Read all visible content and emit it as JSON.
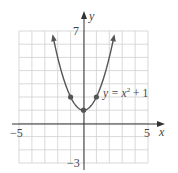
{
  "chart_data": {
    "type": "line",
    "title": "",
    "xlabel": "x",
    "ylabel": "y",
    "xlim": [
      -5,
      5
    ],
    "ylim": [
      -3,
      7
    ],
    "grid": true,
    "x_tick_labels": [
      "-5",
      "5"
    ],
    "y_tick_labels": [
      "7",
      "-3"
    ],
    "series": [
      {
        "name": "y = x² + 1",
        "function": "x^2 + 1",
        "x": [
          -2.449,
          -2,
          -1,
          0,
          1,
          2,
          2.449
        ],
        "y": [
          7,
          5,
          2,
          1,
          2,
          5,
          7
        ],
        "marked_points": [
          [
            -1,
            2
          ],
          [
            0,
            1
          ],
          [
            1,
            2
          ]
        ],
        "color": "#555555"
      }
    ],
    "annotations": [
      {
        "text": "y = x² + 1",
        "x": 1.5,
        "y": 2.3
      }
    ]
  },
  "labels": {
    "x_axis": "x",
    "y_axis": "y",
    "x_min": "−5",
    "x_max": "5",
    "y_max": "7",
    "y_min": "−3",
    "eq_y": "y = x",
    "eq_exp": "2",
    "eq_tail": " + 1"
  }
}
